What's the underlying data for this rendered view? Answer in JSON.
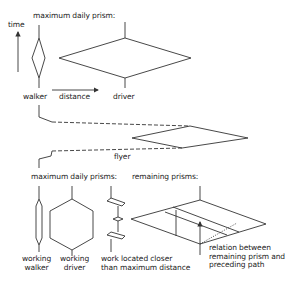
{
  "diagram": {
    "top_section": {
      "axis_label": "time",
      "title": "maximum daily prism:",
      "distance_label": "distance",
      "walker_label": "walker",
      "driver_label": "driver"
    },
    "middle_section": {
      "flyer_label": "flyer"
    },
    "bottom_section": {
      "max_title": "maximum daily prisms:",
      "remaining_title": "remaining prisms:",
      "working_walker": [
        "working",
        "walker"
      ],
      "working_driver": [
        "working",
        "driver"
      ],
      "work_located": [
        "work located closer",
        "than maximum distance"
      ],
      "relation": [
        "relation between",
        "remaining prism and",
        "preceding path"
      ]
    },
    "colors": {
      "line": "#333333",
      "background": "#ffffff"
    }
  }
}
